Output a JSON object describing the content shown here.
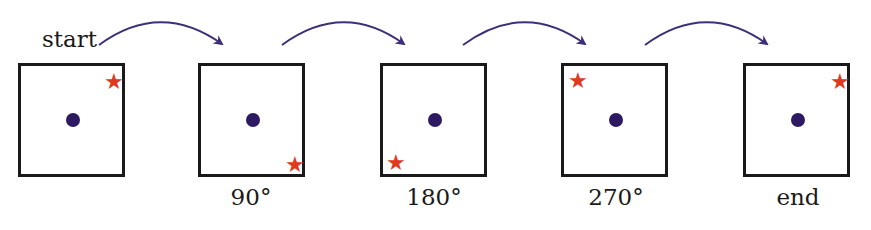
{
  "diagram": {
    "start_label": "start",
    "colors": {
      "arrow": "#3f2f78",
      "dot": "#2e1a63",
      "star": "#e03a1e",
      "box_border": "#1a1a1a"
    },
    "star_glyph": "★",
    "panels": [
      {
        "id": "start",
        "caption": "",
        "star_corner": "top-right"
      },
      {
        "id": "rot90",
        "caption": "90°",
        "star_corner": "bottom-right"
      },
      {
        "id": "rot180",
        "caption": "180°",
        "star_corner": "bottom-left"
      },
      {
        "id": "rot270",
        "caption": "270°",
        "star_corner": "top-left"
      },
      {
        "id": "end",
        "caption": "end",
        "star_corner": "top-right"
      }
    ]
  }
}
